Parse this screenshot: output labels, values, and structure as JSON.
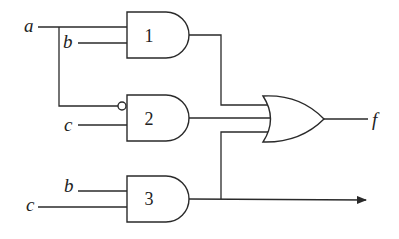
{
  "diagram": {
    "type": "logic-circuit",
    "inputs": [
      {
        "id": "a",
        "label": "a"
      },
      {
        "id": "b1",
        "label": "b"
      },
      {
        "id": "c1",
        "label": "c"
      },
      {
        "id": "b2",
        "label": "b"
      },
      {
        "id": "c2",
        "label": "c"
      }
    ],
    "gates": [
      {
        "id": "g1",
        "type": "AND",
        "label": "1",
        "inputs": [
          "a",
          "b"
        ]
      },
      {
        "id": "g2",
        "type": "AND",
        "label": "2",
        "inputs": [
          "NOT a",
          "c"
        ]
      },
      {
        "id": "g3",
        "type": "AND",
        "label": "3",
        "inputs": [
          "b",
          "c"
        ]
      },
      {
        "id": "g4",
        "type": "OR",
        "label": "",
        "inputs": [
          "g1",
          "g2",
          "g3"
        ]
      }
    ],
    "output": {
      "label": "f"
    },
    "colors": {
      "line": "#2a2a2a",
      "background": "#ffffff"
    }
  }
}
